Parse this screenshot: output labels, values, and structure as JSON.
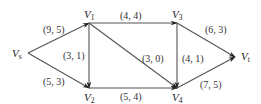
{
  "diagram": {
    "type": "flow-network",
    "nodes": [
      {
        "id": "vs",
        "name": "V",
        "sub": "s",
        "x": 28,
        "y": 53,
        "lx": 12,
        "ly": 57
      },
      {
        "id": "v1",
        "name": "V",
        "sub": "1",
        "x": 89,
        "y": 23,
        "lx": 84,
        "ly": 18
      },
      {
        "id": "v2",
        "name": "V",
        "sub": "2",
        "x": 89,
        "y": 88,
        "lx": 84,
        "ly": 101
      },
      {
        "id": "v3",
        "name": "V",
        "sub": "3",
        "x": 177,
        "y": 23,
        "lx": 172,
        "ly": 18
      },
      {
        "id": "v4",
        "name": "V",
        "sub": "4",
        "x": 177,
        "y": 88,
        "lx": 172,
        "ly": 101
      },
      {
        "id": "vt",
        "name": "V",
        "sub": "t",
        "x": 235,
        "y": 57,
        "lx": 241,
        "ly": 60
      }
    ],
    "edges": [
      {
        "from": "vs",
        "to": "v1",
        "label": "(9, 5)",
        "lx": 43,
        "ly": 33
      },
      {
        "from": "vs",
        "to": "v2",
        "label": "(5, 3)",
        "lx": 43,
        "ly": 85
      },
      {
        "from": "v1",
        "to": "v2",
        "label": "(3, 1)",
        "lx": 63,
        "ly": 59
      },
      {
        "from": "v1",
        "to": "v3",
        "label": "(4, 4)",
        "lx": 120,
        "ly": 19
      },
      {
        "from": "v1",
        "to": "v4",
        "label": "(3, 0)",
        "lx": 142,
        "ly": 62
      },
      {
        "from": "v3",
        "to": "v4",
        "label": "(4, 1)",
        "lx": 182,
        "ly": 62
      },
      {
        "from": "v2",
        "to": "v4",
        "label": "(5, 4)",
        "lx": 120,
        "ly": 100
      },
      {
        "from": "v3",
        "to": "vt",
        "label": "(6, 3)",
        "lx": 205,
        "ly": 33
      },
      {
        "from": "v4",
        "to": "vt",
        "label": "(7, 5)",
        "lx": 200,
        "ly": 88
      }
    ]
  }
}
